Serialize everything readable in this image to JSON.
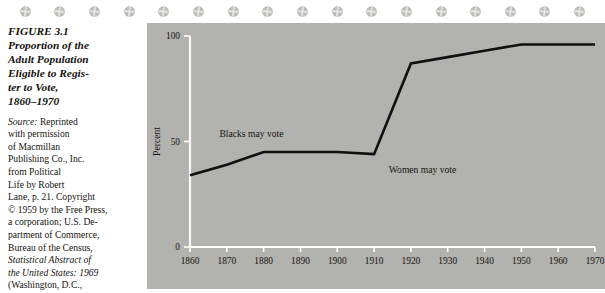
{
  "ornaments": {
    "icon": "rosette-ornament",
    "count": 17,
    "color": "#b9b9b5"
  },
  "caption": {
    "figure_number": "FIGURE 3.1",
    "title_lines": [
      "Proportion of the",
      "Adult Population",
      "Eligible to Regis-",
      "ter to Vote,",
      "1860–1970"
    ],
    "source_label": "Source:",
    "source_lines": [
      " Reprinted",
      "with permission",
      "of Macmillan",
      "Publishing Co., Inc.",
      "from Political",
      "Life by Robert",
      "Lane, p. 21. Copyright",
      "© 1959 by the Free Press,",
      "a corporation; U.S. De-",
      "partment of Commerce,",
      "Bureau of the Census,",
      "Statistical Abstract of",
      "the United States: 1969",
      "(Washington, D.C.,"
    ]
  },
  "chart_data": {
    "type": "line",
    "xlabel": "",
    "ylabel": "Percent",
    "x": [
      1860,
      1870,
      1880,
      1890,
      1900,
      1910,
      1920,
      1930,
      1940,
      1950,
      1960,
      1970
    ],
    "values": [
      34,
      39,
      45,
      45,
      45,
      44,
      87,
      90,
      93,
      96,
      96,
      96
    ],
    "xtick_labels": [
      "1860",
      "1870",
      "1880",
      "1890",
      "1900",
      "1910",
      "1920",
      "1930",
      "1940",
      "1950",
      "1960",
      "1970"
    ],
    "ytick_labels": [
      "0",
      "50",
      "100"
    ],
    "yticks": [
      0,
      50,
      100
    ],
    "xlim": [
      1860,
      1970
    ],
    "ylim": [
      0,
      100
    ],
    "grid": false,
    "legend": "none",
    "line_color": "#12100d",
    "axis_color": "#fdfdfb",
    "background": "#b2b2ae",
    "annotations": [
      {
        "text": "Blacks may vote",
        "x": 1868,
        "y": 52
      },
      {
        "text": "Women may vote",
        "x": 1914,
        "y": 35
      }
    ]
  }
}
